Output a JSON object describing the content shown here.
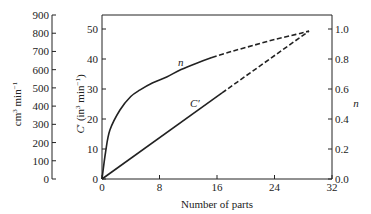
{
  "chart_data": {
    "type": "line",
    "title": "",
    "xlabel": "Number of parts",
    "ylabel": "C′ (in³ min⁻¹)",
    "ylabel_secondary_left": "cm³ min⁻¹",
    "ylabel_right": "n",
    "xlim": [
      0,
      32
    ],
    "ylim": [
      0,
      54.7
    ],
    "ylim_cm3": [
      0,
      900
    ],
    "ylim_right": [
      0,
      1.0
    ],
    "grid": false,
    "legend": "none (curves labeled inline)",
    "x_ticks": [
      "0",
      "8",
      "16",
      "24",
      "32"
    ],
    "y_ticks": [
      "0",
      "10",
      "20",
      "30",
      "40",
      "50"
    ],
    "y_ticks_cm3": [
      "0",
      "100",
      "200",
      "300",
      "400",
      "500",
      "600",
      "700",
      "800",
      "900"
    ],
    "y_ticks_right": [
      "0.0",
      "0.2",
      "0.4",
      "0.6",
      "0.8",
      "1.0"
    ],
    "series": [
      {
        "name": "n",
        "axis": "right",
        "style": "solid then dashed",
        "solid_points": [
          [
            0,
            0
          ],
          [
            0.5,
            9
          ],
          [
            1.1,
            16.3
          ],
          [
            2.5,
            23
          ],
          [
            4,
            27.5
          ],
          [
            5.3,
            29.7
          ],
          [
            7,
            32
          ],
          [
            9,
            34
          ],
          [
            11,
            36.5
          ],
          [
            13.6,
            39
          ],
          [
            15.3,
            40.5
          ]
        ],
        "dashed_points": [
          [
            15.3,
            40.5
          ],
          [
            18,
            42.5
          ],
          [
            21,
            44.5
          ],
          [
            24,
            46.5
          ],
          [
            27,
            48.2
          ],
          [
            28.8,
            49.3
          ]
        ],
        "label": "n"
      },
      {
        "name": "C′",
        "axis": "left",
        "style": "solid then dashed",
        "solid_points": [
          [
            0,
            0
          ],
          [
            16.7,
            28.7
          ]
        ],
        "dashed_points": [
          [
            16.7,
            28.7
          ],
          [
            28.8,
            49.3
          ]
        ],
        "label": "C′"
      }
    ]
  },
  "labels": {
    "xlabel": "Number of parts",
    "ylabel_main": "C′ (in³ min⁻¹)",
    "ylabel_cm3": "cm³ min⁻¹",
    "ylabel_right": "n",
    "curve_n": "n",
    "curve_c": "C′"
  }
}
